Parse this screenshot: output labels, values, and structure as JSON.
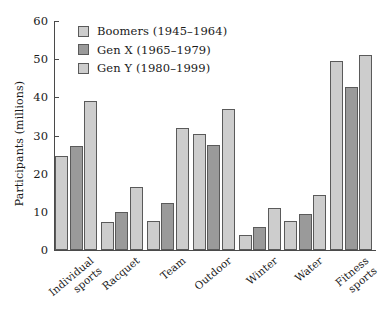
{
  "chart_data": {
    "type": "bar",
    "title": "",
    "subtitle": "",
    "xlabel": "",
    "ylabel": "Participants (millions)",
    "ylim": [
      0,
      60
    ],
    "yticks": [
      0,
      10,
      20,
      30,
      40,
      50,
      60
    ],
    "ytick_labels": [
      "0",
      "10",
      "20",
      "30",
      "40",
      "50",
      "60"
    ],
    "grid": false,
    "legend_position": "top-left-inside",
    "categories": [
      "Individual\nsports",
      "Racquet",
      "Team",
      "Outdoor",
      "Winter",
      "Water",
      "Fitness\nsports"
    ],
    "series": [
      {
        "name": "Boomers (1945–1964)",
        "color": "#cdcdcd",
        "values": [
          24.7,
          7.4,
          7.5,
          30.5,
          4.0,
          7.7,
          49.5
        ]
      },
      {
        "name": "Gen X (1965–1979)",
        "color": "#9a9a9a",
        "values": [
          27.2,
          10.0,
          12.3,
          27.6,
          6.0,
          9.4,
          42.6
        ]
      },
      {
        "name": "Gen Y (1980–1999)",
        "color": "#cdcdcd",
        "values": [
          39.0,
          16.5,
          32.0,
          37.0,
          11.1,
          14.4,
          51.0
        ]
      }
    ]
  }
}
